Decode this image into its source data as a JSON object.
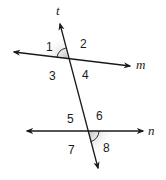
{
  "diagram": {
    "lines": {
      "transversal": {
        "label": "t"
      },
      "line_top": {
        "label": "m"
      },
      "line_bottom": {
        "label": "n"
      }
    },
    "angles": [
      {
        "id": "1",
        "label": "1",
        "highlighted": true
      },
      {
        "id": "2",
        "label": "2",
        "highlighted": false
      },
      {
        "id": "3",
        "label": "3",
        "highlighted": false
      },
      {
        "id": "4",
        "label": "4",
        "highlighted": false
      },
      {
        "id": "5",
        "label": "5",
        "highlighted": false
      },
      {
        "id": "6",
        "label": "6",
        "highlighted": false
      },
      {
        "id": "7",
        "label": "7",
        "highlighted": false
      },
      {
        "id": "8",
        "label": "8",
        "highlighted": true
      }
    ],
    "colors": {
      "line": "#1a1a1a",
      "highlight": "#bdbdbd",
      "background": "#ffffff"
    }
  }
}
